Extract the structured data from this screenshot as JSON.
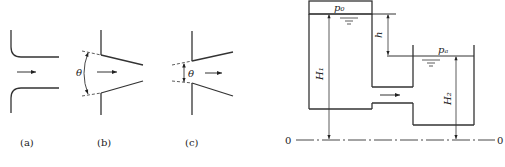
{
  "figures": {
    "a": {
      "caption": "(a)"
    },
    "b": {
      "caption": "(b)",
      "angle_label": "θ"
    },
    "c": {
      "caption": "(c)",
      "angle_label": "θ"
    }
  },
  "tank_diagram": {
    "upper_pressure": "p₀",
    "lower_pressure": "pₐ",
    "head_difference": "h",
    "height_left": "H₁",
    "height_right": "H₂",
    "datum_left": "0",
    "datum_right": "0"
  },
  "colors": {
    "line": "#333333",
    "background": "#ffffff"
  }
}
